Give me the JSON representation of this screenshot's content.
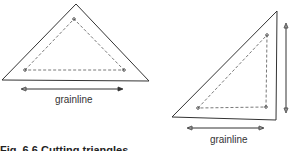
{
  "figure": {
    "left_piece": {
      "grainline_label": "grainline"
    },
    "right_piece": {
      "grainline_label": "grainline"
    },
    "caption": "Fig. 6.6  Cutting triangles"
  },
  "colors": {
    "line": "#333333",
    "background": "#ffffff"
  }
}
